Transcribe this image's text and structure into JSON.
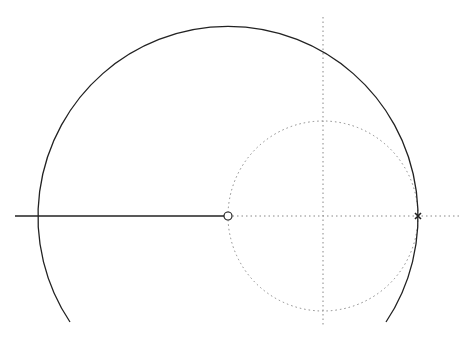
{
  "diagram": {
    "type": "root-locus",
    "width": 459,
    "height": 338,
    "colors": {
      "background": "#ffffff",
      "locus": "#222222",
      "axes": "#888888"
    },
    "axes": {
      "real_axis": {
        "y": 216,
        "x_start": 228,
        "x_end": 459,
        "style": "dotted"
      },
      "imag_axis": {
        "x": 323,
        "y_start": 17,
        "y_end": 326,
        "style": "dotted"
      }
    },
    "unit_circle": {
      "cx": 323,
      "cy": 216,
      "r": 95,
      "style": "dotted"
    },
    "locus_arc": {
      "cx": 229,
      "cy": 217,
      "r": 190,
      "start": [
        70,
        322
      ],
      "end": [
        386,
        322
      ],
      "style": "solid"
    },
    "real_axis_segment": {
      "x_start": 15,
      "x_end": 228,
      "y": 216,
      "style": "solid"
    },
    "markers": [
      {
        "kind": "zero",
        "symbol": "o",
        "x": 228,
        "y": 216
      },
      {
        "kind": "pole",
        "symbol": "x",
        "x": 418,
        "y": 216
      }
    ]
  }
}
